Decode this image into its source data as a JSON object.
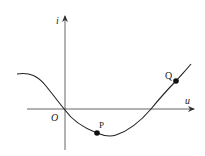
{
  "diagram": {
    "type": "i-u characteristic curve",
    "axes": {
      "vertical_label": "i",
      "horizontal_label": "u",
      "origin_label": "O"
    },
    "points": [
      {
        "label": "P",
        "description": "point on curve below u-axis, near minimum"
      },
      {
        "label": "Q",
        "description": "point on curve above u-axis, right side"
      }
    ],
    "colors": {
      "curve": "#222222",
      "axis": "#444444",
      "point": "#111111"
    }
  }
}
